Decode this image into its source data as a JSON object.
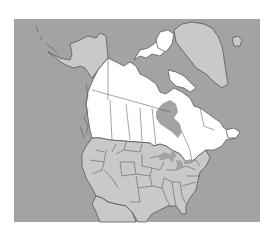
{
  "map": {
    "title": "",
    "highlighted_region": "Canada",
    "regions": [
      "Alaska",
      "Canada",
      "Greenland",
      "United States",
      "Mexico"
    ],
    "colors": {
      "ocean": "#a3a3a3",
      "land": "#c9c9c9",
      "highlight": "#ffffff",
      "border": "#4a4a4a",
      "background": "#ffffff"
    }
  }
}
